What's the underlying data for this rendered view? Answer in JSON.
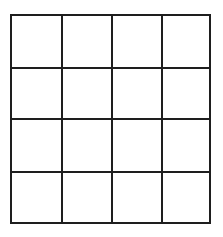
{
  "grid": {
    "rows": 4,
    "columns": 4,
    "line_color": "#1e1e1e",
    "background_color": "#ffffff",
    "cells": [
      [
        "",
        "",
        "",
        ""
      ],
      [
        "",
        "",
        "",
        ""
      ],
      [
        "",
        "",
        "",
        ""
      ],
      [
        "",
        "",
        "",
        ""
      ]
    ]
  }
}
